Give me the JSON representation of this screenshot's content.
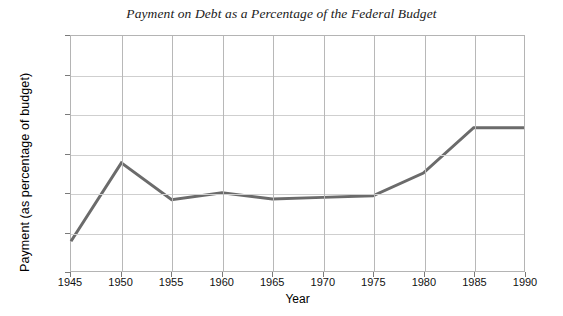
{
  "chart_data": {
    "type": "line",
    "title": "Payment on Debt as a Percentage of the Federal Budget",
    "xlabel": "Year",
    "ylabel": "Payment (as percentage of budget)",
    "x": [
      1945,
      1950,
      1955,
      1960,
      1965,
      1970,
      1975,
      1980,
      1985,
      1990
    ],
    "values": [
      3.8,
      13.8,
      9.1,
      10.0,
      9.2,
      9.4,
      9.6,
      12.5,
      18.3,
      18.3
    ],
    "series": [
      {
        "name": "Payment on debt",
        "values": [
          3.8,
          13.8,
          9.1,
          10.0,
          9.2,
          9.4,
          9.6,
          12.5,
          18.3,
          18.3
        ]
      }
    ],
    "xlim": [
      1945,
      1990
    ],
    "ylim": [
      0,
      30
    ],
    "xticks": [
      1945,
      1950,
      1955,
      1960,
      1965,
      1970,
      1975,
      1980,
      1985,
      1990
    ],
    "xtick_labels": [
      "1945",
      "1950",
      "1955",
      "1960",
      "1965",
      "1970",
      "1975",
      "1980",
      "1985",
      "1990"
    ],
    "yticks": [
      0,
      5,
      10,
      15,
      20,
      25,
      30
    ],
    "ytick_labels": [
      "0",
      "5",
      "10",
      "15",
      "20",
      "25",
      "30"
    ],
    "y_top_prefix": "%",
    "y_top_label": "% 30",
    "grid": true,
    "legend": "none",
    "line_color": "#6b6b6b",
    "line_width": 3,
    "grid_color": "#cfcfcf",
    "axis_color": "#b4b4b4",
    "background": "#ffffff"
  }
}
